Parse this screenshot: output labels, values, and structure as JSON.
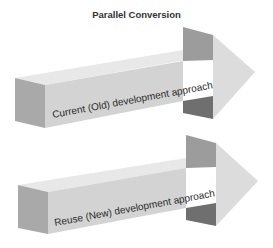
{
  "title": "Parallel Conversion",
  "arrows": [
    {
      "label": "Current (Old) development approach"
    },
    {
      "label": "Reuse (New) development approach"
    }
  ],
  "colors": {
    "front_face": "#d2d2d2",
    "top_face": "#e6e6e6",
    "end_cap": "#a8a8a8",
    "upper_flange": "#9a9a9a",
    "lower_flange": "#6e6e6e",
    "head_face": "#dcdcdc",
    "text": "#2a2a2a"
  }
}
